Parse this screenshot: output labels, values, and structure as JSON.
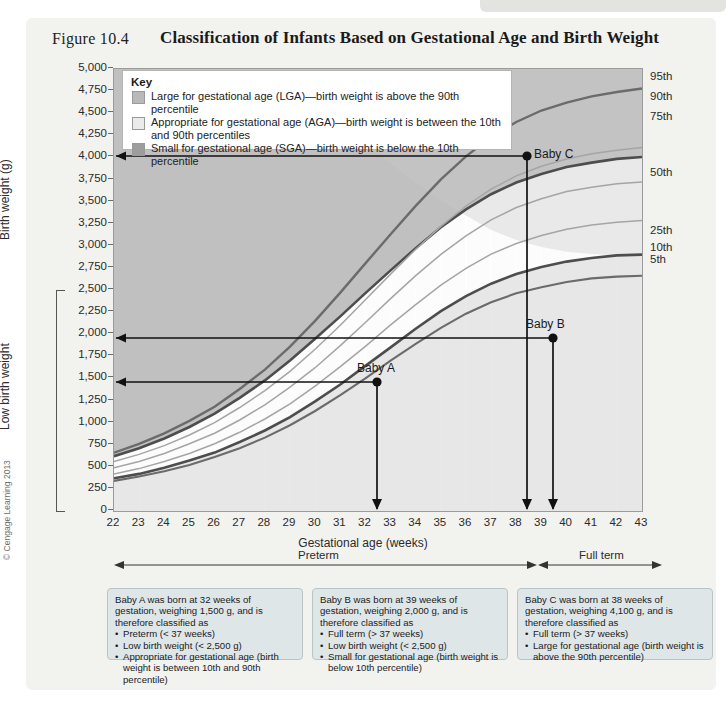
{
  "figure": {
    "label": "Figure 10.4",
    "title": "Classification of Infants Based on Gestational Age and Birth Weight",
    "copyright": "© Cengage Learning 2013"
  },
  "key": {
    "title": "Key",
    "items": [
      {
        "swatch": "#b9b9b9",
        "text": "Large for gestational age (LGA)—birth weight is above the 90th percentile"
      },
      {
        "swatch": "#ebebeb",
        "text": "Appropriate for gestational age (AGA)—birth weight is between the 10th and 90th percentiles"
      },
      {
        "swatch": "#9d9d9d",
        "text": "Small for gestational age (SGA)—birth weight is below the 10th percentile"
      }
    ]
  },
  "axes": {
    "y_label": "Birth weight (g)",
    "y_secondary_label": "Low birth weight",
    "x_label": "Gestational age (weeks)",
    "y_ticks": [
      "5,000",
      "4,750",
      "4,500",
      "4,250",
      "4,000",
      "3,750",
      "3,500",
      "3,250",
      "3,000",
      "2,750",
      "2,500",
      "2,250",
      "2,000",
      "1,750",
      "1,500",
      "1,250",
      "1,000",
      "750",
      "500",
      "250",
      "0"
    ],
    "x_ticks": [
      "22",
      "23",
      "24",
      "25",
      "26",
      "27",
      "28",
      "29",
      "30",
      "31",
      "32",
      "33",
      "34",
      "35",
      "36",
      "37",
      "38",
      "39",
      "40",
      "41",
      "42",
      "43"
    ],
    "percentile_labels": [
      "95th",
      "90th",
      "75th",
      "50th",
      "25th",
      "10th",
      "5th"
    ],
    "ylim": [
      0,
      5000
    ],
    "xlim": [
      22,
      43
    ]
  },
  "term_bands": {
    "preterm": "Preterm",
    "full_term": "Full term"
  },
  "babies": [
    {
      "name": "Baby A",
      "weeks": 32,
      "weight": 1500
    },
    {
      "name": "Baby B",
      "weeks": 39,
      "weight": 2000
    },
    {
      "name": "Baby C",
      "weeks": 38,
      "weight": 4100
    }
  ],
  "notes": [
    {
      "id": "note-a",
      "intro": "Baby A was born at 32 weeks of gestation, weighing 1,500 g, and is therefore classified as",
      "bullets": [
        "Preterm (< 37 weeks)",
        "Low birth weight (< 2,500 g)",
        "Appropriate for gestational age (birth weight is between 10th and 90th percentile)"
      ]
    },
    {
      "id": "note-b",
      "intro": "Baby B was born at 39 weeks of gestation, weighing 2,000 g, and is therefore classified as",
      "bullets": [
        "Full term (> 37 weeks)",
        "Low birth weight (< 2,500 g)",
        "Small for gestational age (birth weight is below 10th percentile)"
      ]
    },
    {
      "id": "note-c",
      "intro": "Baby C was born at 38 weeks of gestation, weighing 4,100 g, and is therefore classified as",
      "bullets": [
        "Full term (> 37 weeks)",
        "Large for gestational age (birth weight is above the 90th percentile)"
      ]
    }
  ],
  "chart_data": {
    "type": "line",
    "title": "Classification of Infants Based on Gestational Age and Birth Weight",
    "xlabel": "Gestational age (weeks)",
    "ylabel": "Birth weight (g)",
    "xlim": [
      22,
      43
    ],
    "ylim": [
      0,
      5000
    ],
    "grid": true,
    "legend_position": "top-left",
    "x": [
      22,
      23,
      24,
      25,
      26,
      27,
      28,
      29,
      30,
      31,
      32,
      33,
      34,
      35,
      36,
      37,
      38,
      39,
      40,
      41,
      42,
      43
    ],
    "series": [
      {
        "name": "95th",
        "values": [
          660,
          760,
          880,
          1020,
          1180,
          1380,
          1600,
          1860,
          2150,
          2470,
          2800,
          3130,
          3450,
          3750,
          4010,
          4230,
          4400,
          4530,
          4620,
          4690,
          4740,
          4780
        ]
      },
      {
        "name": "90th",
        "values": [
          620,
          710,
          820,
          950,
          1100,
          1290,
          1500,
          1740,
          2010,
          2310,
          2620,
          2930,
          3230,
          3510,
          3760,
          3970,
          4130,
          4250,
          4340,
          4400,
          4450,
          4480
        ]
      },
      {
        "name": "75th",
        "values": [
          560,
          640,
          740,
          860,
          1000,
          1170,
          1360,
          1580,
          1830,
          2100,
          2390,
          2680,
          2960,
          3220,
          3450,
          3640,
          3790,
          3900,
          3980,
          4040,
          4080,
          4110
        ]
      },
      {
        "name": "50th",
        "values": [
          490,
          560,
          650,
          760,
          880,
          1030,
          1200,
          1400,
          1620,
          1870,
          2130,
          2400,
          2660,
          2900,
          3110,
          3290,
          3430,
          3530,
          3610,
          3660,
          3700,
          3720
        ]
      },
      {
        "name": "25th",
        "values": [
          420,
          480,
          560,
          650,
          760,
          890,
          1040,
          1210,
          1410,
          1630,
          1860,
          2100,
          2330,
          2550,
          2740,
          2900,
          3020,
          3110,
          3180,
          3230,
          3260,
          3280
        ]
      },
      {
        "name": "10th",
        "values": [
          370,
          420,
          490,
          570,
          660,
          780,
          910,
          1060,
          1240,
          1430,
          1640,
          1850,
          2060,
          2260,
          2430,
          2570,
          2680,
          2760,
          2820,
          2860,
          2890,
          2900
        ]
      },
      {
        "name": "5th",
        "values": [
          340,
          390,
          450,
          520,
          610,
          710,
          830,
          970,
          1130,
          1310,
          1500,
          1700,
          1890,
          2070,
          2230,
          2360,
          2460,
          2530,
          2590,
          2630,
          2650,
          2660
        ]
      }
    ],
    "annotations": [
      {
        "label": "Baby A",
        "x": 32,
        "y": 1500
      },
      {
        "label": "Baby B",
        "x": 39,
        "y": 2000
      },
      {
        "label": "Baby C",
        "x": 38,
        "y": 4100
      }
    ],
    "bands": [
      {
        "name": "LGA",
        "above": "90th",
        "color": "#b9b9b9"
      },
      {
        "name": "AGA",
        "between": [
          "10th",
          "90th"
        ],
        "color": "#ebebeb"
      },
      {
        "name": "SGA",
        "below": "10th",
        "color": "#9d9d9d"
      }
    ]
  }
}
